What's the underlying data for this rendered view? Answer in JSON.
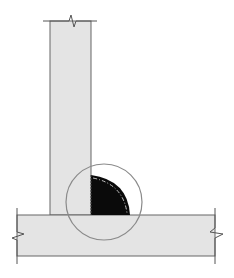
{
  "diagram": {
    "colors": {
      "background": "#ffffff",
      "plate_fill": "#e4e4e4",
      "plate_stroke": "#666666",
      "weld_fill": "#0a0a0a",
      "weld_centerline": "#bfbfbf",
      "detail_circle": "#8a8a8a",
      "break_line": "#555555"
    },
    "components": [
      {
        "id": "vertical-plate",
        "label": "Vertical member (web)",
        "x": 50,
        "y": 21,
        "width": 41,
        "height": 194
      },
      {
        "id": "horizontal-plate",
        "label": "Horizontal member (flange)",
        "x": 17,
        "y": 215,
        "width": 198,
        "height": 41
      },
      {
        "id": "fillet-weld",
        "label": "Fillet weld",
        "leg_vertical": 40,
        "leg_horizontal": 39
      },
      {
        "id": "detail-circle",
        "label": "Detail callout",
        "cx": 104,
        "cy": 202,
        "r": 38
      }
    ],
    "break_lines": [
      "top",
      "left",
      "right"
    ]
  }
}
